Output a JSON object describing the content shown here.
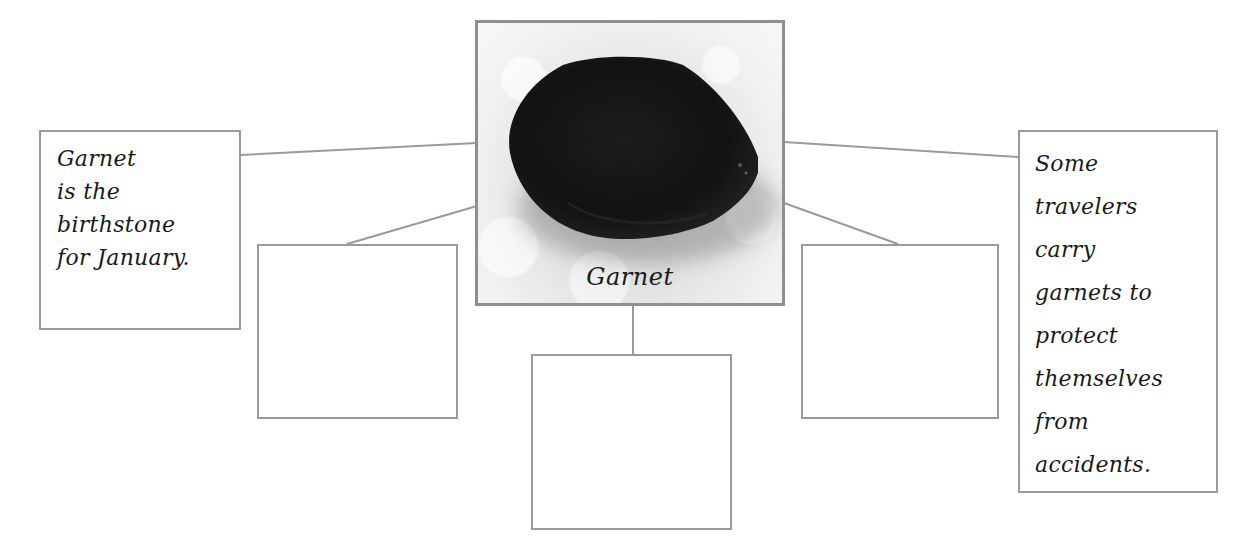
{
  "diagram": {
    "type": "web organizer",
    "center": {
      "caption": "Garnet",
      "image": "garnet-stone-photo"
    },
    "left_fact": {
      "lines": [
        "Garnet",
        "is the",
        "birthstone",
        "for January."
      ]
    },
    "right_fact": {
      "lines": [
        "Some",
        "travelers",
        "carry",
        "garnets to",
        "protect",
        "themselves",
        "from",
        "accidents."
      ]
    },
    "blank_boxes": [
      {
        "position": "lower-left",
        "text": ""
      },
      {
        "position": "bottom-center",
        "text": ""
      },
      {
        "position": "lower-right",
        "text": ""
      }
    ]
  },
  "colors": {
    "border": "#9a9a9a",
    "line": "#9a9a9a",
    "text": "#1a1a1a",
    "stone": "#141414",
    "background": "#ffffff"
  }
}
